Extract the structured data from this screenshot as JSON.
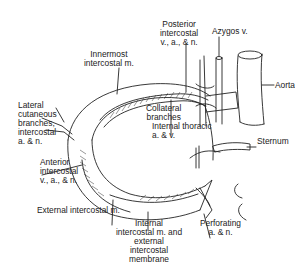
{
  "diagram": {
    "type": "anatomical-illustration",
    "labels": {
      "posterior": [
        "Posterior",
        "intercostal",
        "v., a., & n."
      ],
      "azygos": "Azygos v.",
      "innermost": [
        "Innermost",
        "intercostal m."
      ],
      "aorta": "Aorta",
      "collateral": [
        "Collateral",
        "branches"
      ],
      "lateral": [
        "Lateral",
        "cutaneous",
        "branches,",
        "intercostal",
        "a. & n."
      ],
      "internal_thoracic": [
        "Internal thoracic",
        "a. & v."
      ],
      "sternum": "Sternum",
      "anterior": [
        "Anterior",
        "intercostal",
        "v., a., & n."
      ],
      "external": "External intercostal m.",
      "internal": [
        "Internal",
        "intercostal m. and external",
        "intercostal",
        "membrane"
      ],
      "perforating": [
        "Perforating",
        "a. & n."
      ]
    },
    "colors": {
      "ink": "#222222",
      "background": "#ffffff"
    }
  }
}
